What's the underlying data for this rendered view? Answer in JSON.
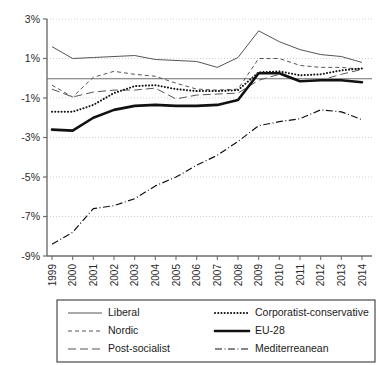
{
  "chart_data": {
    "type": "line",
    "title": "",
    "subtitle": "",
    "xlabel": "",
    "ylabel": "",
    "x": [
      1999,
      2000,
      2001,
      2002,
      2003,
      2004,
      2005,
      2006,
      2007,
      2008,
      2009,
      2010,
      2011,
      2012,
      2013,
      2014
    ],
    "xticklabels": [
      "1999",
      "2000",
      "2001",
      "2002",
      "2003",
      "2004",
      "2005",
      "2006",
      "2007",
      "2008",
      "2009",
      "2010",
      "2011",
      "2012",
      "2013",
      "2014"
    ],
    "yticklabels": [
      "3%",
      "1%",
      "-1%",
      "-3%",
      "-5%",
      "-7%",
      "-9%"
    ],
    "ytickvalues": [
      3,
      1,
      -1,
      -3,
      -5,
      -7,
      -9
    ],
    "ylim": [
      -9,
      3
    ],
    "xlim": [
      1999,
      2014
    ],
    "grid": "horizontal-dotted",
    "zero_line": true,
    "legend_position": "below-plot",
    "series": [
      {
        "name": "Liberal",
        "style": "solid-thin",
        "color": "#555555",
        "values": [
          1.6,
          1.0,
          1.05,
          1.1,
          1.15,
          0.95,
          0.9,
          0.85,
          0.55,
          1.05,
          2.4,
          1.85,
          1.45,
          1.2,
          1.1,
          0.8
        ]
      },
      {
        "name": "Nordic",
        "style": "short-dash",
        "color": "#555555",
        "values": [
          -0.35,
          -0.95,
          0.05,
          0.35,
          0.2,
          0.1,
          -0.25,
          -0.55,
          -0.6,
          -0.55,
          1.0,
          1.0,
          0.65,
          0.55,
          0.55,
          0.45
        ]
      },
      {
        "name": "Post-socialist",
        "style": "long-dash",
        "color": "#555555",
        "values": [
          -0.55,
          -0.95,
          -0.7,
          -0.6,
          -0.6,
          -0.5,
          -1.05,
          -0.85,
          -0.8,
          -0.75,
          -0.1,
          0.2,
          -0.15,
          -0.1,
          0.2,
          0.45
        ]
      },
      {
        "name": "Corporatist-conservative",
        "style": "dotted",
        "color": "#111111",
        "values": [
          -1.7,
          -1.7,
          -1.35,
          -0.75,
          -0.4,
          -0.35,
          -0.55,
          -0.65,
          -0.65,
          -0.6,
          0.3,
          0.35,
          0.15,
          0.2,
          0.4,
          0.5
        ]
      },
      {
        "name": "EU-28",
        "style": "solid-thick",
        "color": "#111111",
        "values": [
          -2.6,
          -2.65,
          -2.0,
          -1.6,
          -1.4,
          -1.35,
          -1.4,
          -1.4,
          -1.35,
          -1.1,
          0.25,
          0.25,
          -0.15,
          -0.1,
          -0.1,
          -0.2
        ]
      },
      {
        "name": "Mediterreanean",
        "style": "dash-dot",
        "color": "#111111",
        "values": [
          -8.4,
          -7.8,
          -6.6,
          -6.45,
          -6.1,
          -5.45,
          -5.0,
          -4.4,
          -3.9,
          -3.2,
          -2.4,
          -2.2,
          -2.05,
          -1.6,
          -1.7,
          -2.1
        ]
      }
    ]
  },
  "legend": {
    "entries": [
      {
        "label": "Liberal",
        "series": "Liberal"
      },
      {
        "label": "Corporatist-conservative",
        "series": "Corporatist-conservative"
      },
      {
        "label": "Nordic",
        "series": "Nordic"
      },
      {
        "label": "EU-28",
        "series": "EU-28"
      },
      {
        "label": "Post-socialist",
        "series": "Post-socialist"
      },
      {
        "label": "Mediterreanean",
        "series": "Mediterreanean"
      }
    ]
  }
}
